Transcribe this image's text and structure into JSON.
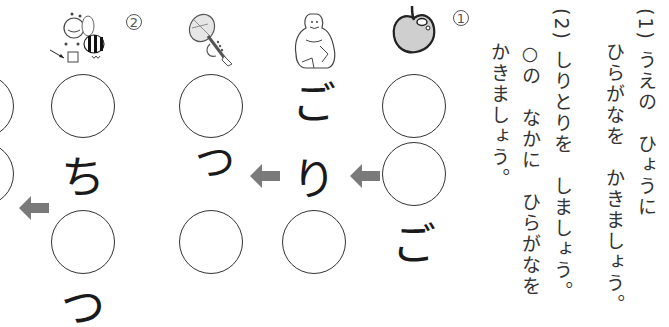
{
  "instructions": {
    "q1": {
      "number": "(1)",
      "line1": "うえの　ひょうに",
      "line2": "ひらがなを　かきましょう。"
    },
    "q2": {
      "number": "(2)",
      "line1": "しりとりを　しましょう。",
      "line2": "○の　なかに　ひらがなを",
      "line3": "かきましょう。"
    }
  },
  "puzzles": [
    {
      "label": "①",
      "picture": "apple-icon",
      "columns": [
        {
          "picture": "apple-icon",
          "cells": [
            "",
            "",
            "ご"
          ]
        },
        {
          "picture": "gorilla-icon",
          "cells": [
            "ご",
            "り",
            ""
          ]
        },
        {
          "picture": "trumpet-icon",
          "cells": [
            "",
            "つ",
            ""
          ]
        }
      ]
    },
    {
      "label": "②",
      "columns": [
        {
          "picture": "bee-icon",
          "cells": [
            "",
            "ち",
            "",
            "つ"
          ]
        },
        {
          "picture": "unknown",
          "cells": [
            "",
            ""
          ]
        }
      ]
    }
  ],
  "kana": {
    "apple_bottom": "ご",
    "gorilla_top": "ご",
    "gorilla_mid": "り",
    "trumpet_mid": "つ",
    "bee_mid": "ち",
    "bee_bottom": "つ"
  },
  "labels": {
    "circled_1": "①",
    "circled_2": "②"
  },
  "colors": {
    "arrow": "#7a7a7a",
    "circle_stroke": "#333333",
    "apple_fill": "#c8c8c8"
  }
}
